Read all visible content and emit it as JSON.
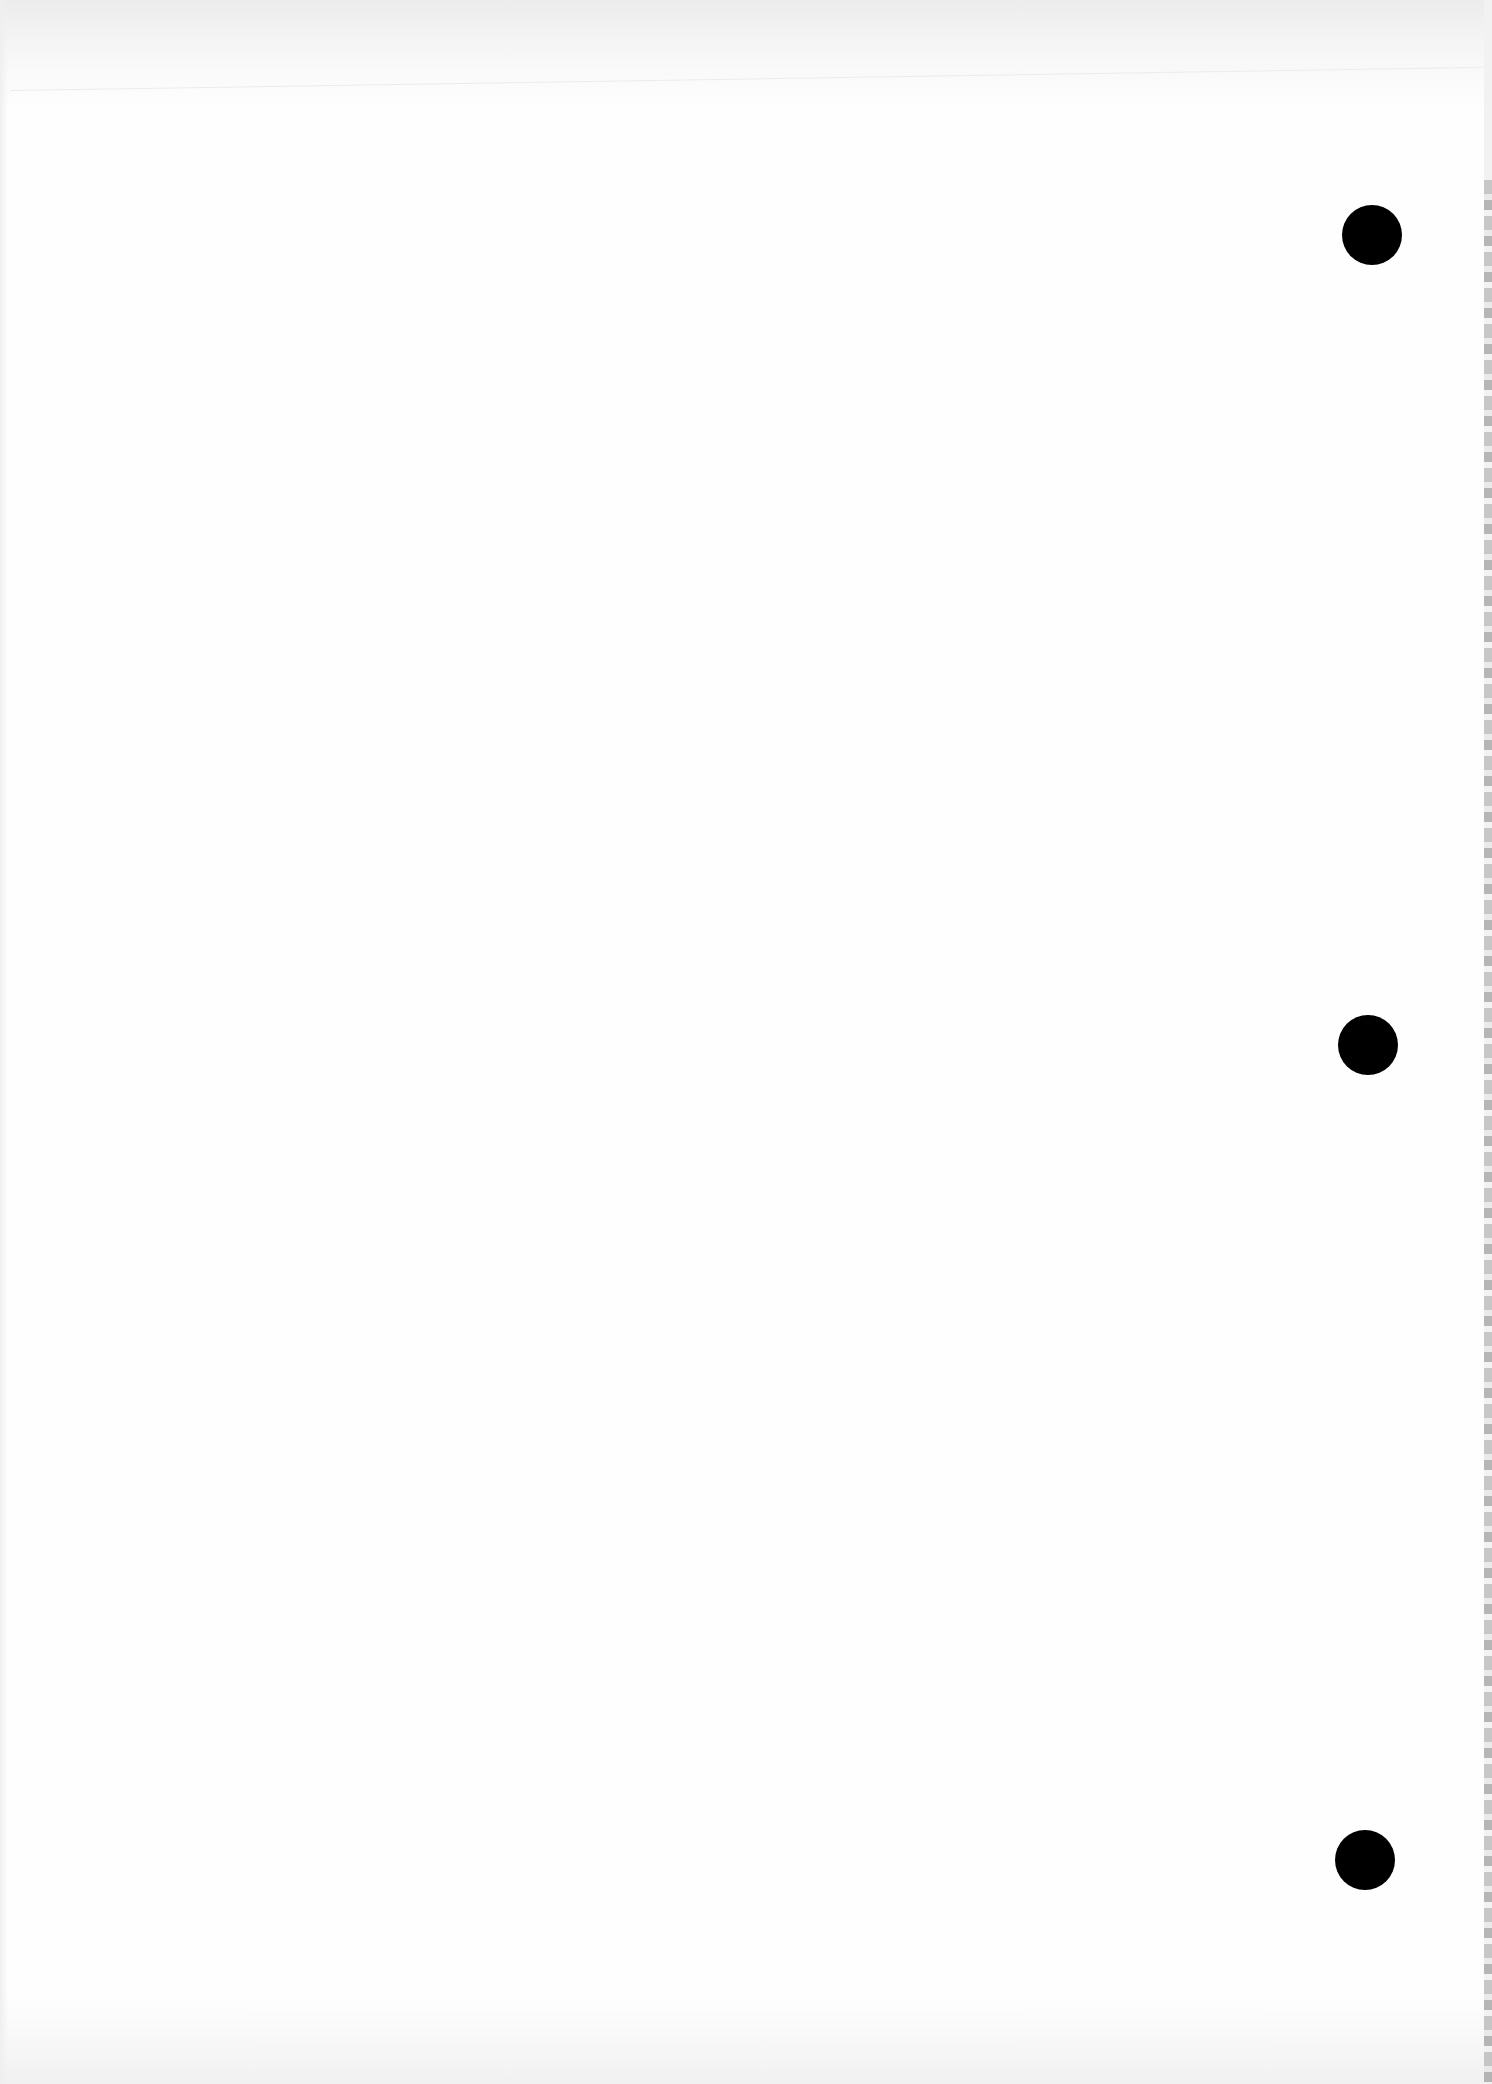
{
  "document": {
    "type": "blank scanned page",
    "text_content": "",
    "punch_holes": [
      {
        "label": "top",
        "cx": 1372,
        "cy": 235,
        "r": 30
      },
      {
        "label": "middle",
        "cx": 1368,
        "cy": 1045,
        "r": 30
      },
      {
        "label": "bottom",
        "cx": 1365,
        "cy": 1860,
        "r": 30
      }
    ],
    "colors": {
      "paper": "#fefefe",
      "hole": "#000000",
      "edge_strip": "#bdbdbd"
    }
  }
}
